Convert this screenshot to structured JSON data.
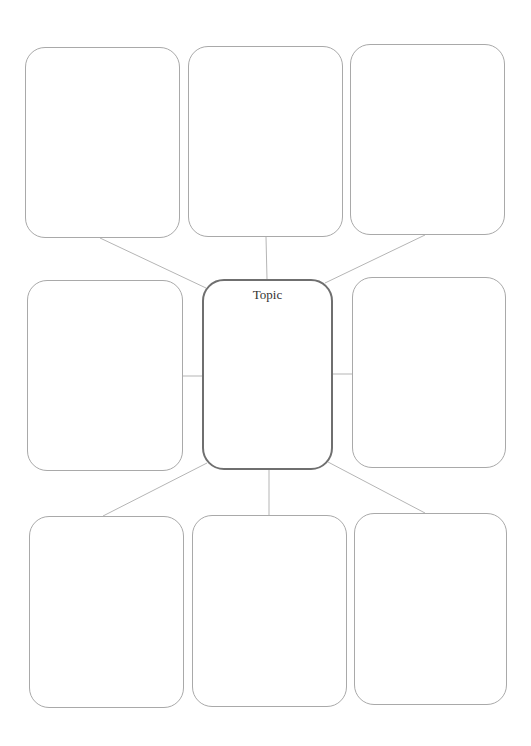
{
  "diagram": {
    "type": "spider-map",
    "center": {
      "label": "Topic",
      "rect": {
        "x": 202,
        "y": 279,
        "w": 131,
        "h": 191
      }
    },
    "nodes": [
      {
        "id": "top-left",
        "label": "",
        "rect": {
          "x": 25,
          "y": 47,
          "w": 155,
          "h": 191
        },
        "anchor": {
          "x": 100,
          "y": 238
        },
        "center_anchor": {
          "x": 206,
          "y": 288
        }
      },
      {
        "id": "top-middle",
        "label": "",
        "rect": {
          "x": 188,
          "y": 46,
          "w": 155,
          "h": 191
        },
        "anchor": {
          "x": 266,
          "y": 237
        },
        "center_anchor": {
          "x": 267,
          "y": 279
        }
      },
      {
        "id": "top-right",
        "label": "",
        "rect": {
          "x": 350,
          "y": 44,
          "w": 155,
          "h": 191
        },
        "anchor": {
          "x": 425,
          "y": 235
        },
        "center_anchor": {
          "x": 325,
          "y": 283
        }
      },
      {
        "id": "middle-left",
        "label": "",
        "rect": {
          "x": 27,
          "y": 280,
          "w": 156,
          "h": 191
        },
        "anchor": {
          "x": 183,
          "y": 376
        },
        "center_anchor": {
          "x": 202,
          "y": 376
        }
      },
      {
        "id": "middle-right",
        "label": "",
        "rect": {
          "x": 352,
          "y": 277,
          "w": 154,
          "h": 191
        },
        "anchor": {
          "x": 352,
          "y": 374
        },
        "center_anchor": {
          "x": 333,
          "y": 374
        }
      },
      {
        "id": "bottom-left",
        "label": "",
        "rect": {
          "x": 29,
          "y": 516,
          "w": 155,
          "h": 192
        },
        "anchor": {
          "x": 103,
          "y": 516
        },
        "center_anchor": {
          "x": 207,
          "y": 463
        }
      },
      {
        "id": "bottom-middle",
        "label": "",
        "rect": {
          "x": 192,
          "y": 515,
          "w": 155,
          "h": 192
        },
        "anchor": {
          "x": 269,
          "y": 515
        },
        "center_anchor": {
          "x": 269,
          "y": 470
        }
      },
      {
        "id": "bottom-right",
        "label": "",
        "rect": {
          "x": 354,
          "y": 513,
          "w": 153,
          "h": 192
        },
        "anchor": {
          "x": 425,
          "y": 513
        },
        "center_anchor": {
          "x": 328,
          "y": 462
        }
      }
    ],
    "colors": {
      "node_border": "#a9a9a9",
      "center_border": "#6f6f6f",
      "connector": "#b5b5b5",
      "background": "#ffffff"
    }
  }
}
